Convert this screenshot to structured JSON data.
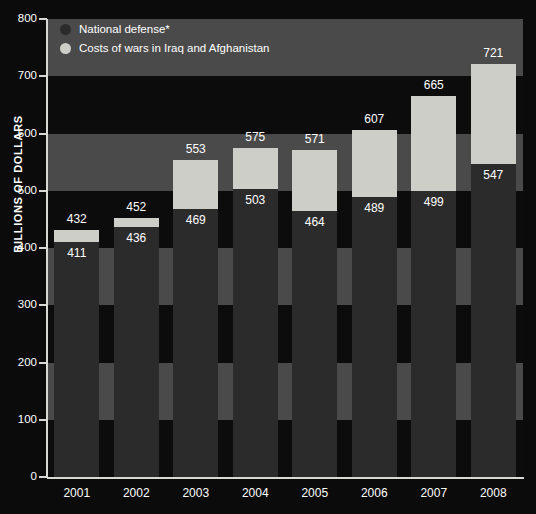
{
  "chart_data": {
    "type": "bar",
    "subtype": "stacked",
    "title": "",
    "xlabel": "",
    "ylabel": "BILLIONS OF DOLLARS",
    "ylim": [
      0,
      800
    ],
    "ytick_step": 100,
    "yticks": [
      "800",
      "700",
      "600",
      "500",
      "400",
      "300",
      "200",
      "100",
      "0"
    ],
    "categories": [
      "2001",
      "2002",
      "2003",
      "2004",
      "2005",
      "2006",
      "2007",
      "2008"
    ],
    "grid": "alternating horizontal bands every 100 units",
    "legend_position": "top-left inside plot",
    "series": [
      {
        "name": "National defense*",
        "color": "#2b2b2b",
        "values": [
          411,
          436,
          469,
          503,
          464,
          489,
          499,
          547
        ],
        "labels": [
          "411",
          "436",
          "469",
          "503",
          "464",
          "489",
          "499",
          "547"
        ]
      },
      {
        "name": "Costs of wars in Iraq and Afghanistan",
        "color": "#cecec9",
        "values": [
          21,
          16,
          84,
          72,
          107,
          118,
          166,
          174
        ]
      }
    ],
    "totals": [
      432,
      452,
      553,
      575,
      571,
      607,
      665,
      721
    ],
    "total_labels": [
      "432",
      "452",
      "553",
      "575",
      "571",
      "607",
      "665",
      "721"
    ]
  },
  "legend": {
    "items": [
      {
        "label": "National defense*",
        "color": "#2b2b2b"
      },
      {
        "label": "Costs of wars in Iraq and Afghanistan",
        "color": "#cecec9"
      }
    ]
  },
  "colors": {
    "background": "#0b0b0b",
    "band": "#4a4a4a",
    "axis": "#d8d8d4",
    "text": "#ffffff",
    "bar_defense": "#2b2b2b",
    "bar_war": "#cecec9"
  }
}
